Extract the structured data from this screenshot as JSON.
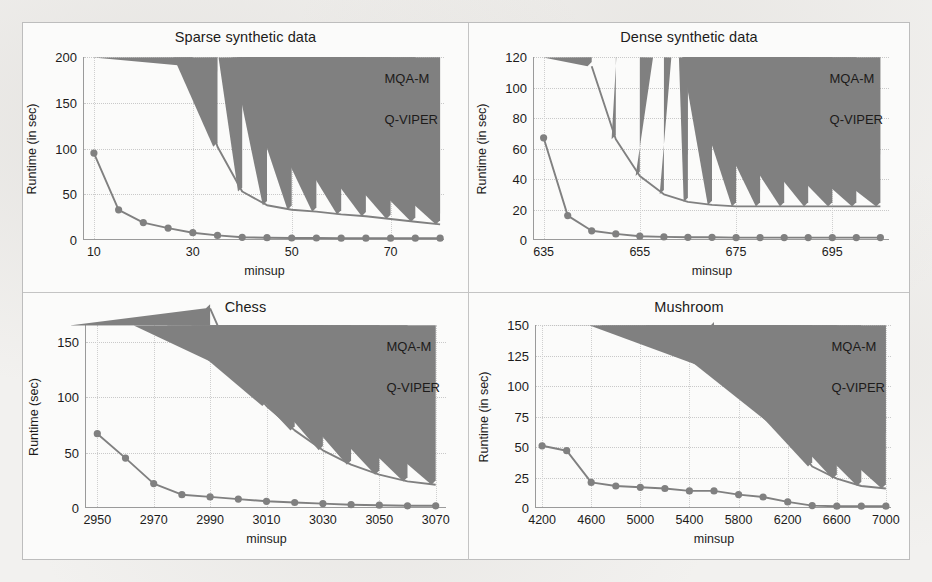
{
  "figure": {
    "background_color": "#fbfbfa",
    "series_color": "#808080",
    "grid_color": "#c9c9c9",
    "axis_color": "#9a9a9a"
  },
  "legend": {
    "series": [
      {
        "name": "MQA-M",
        "marker": "triangle-marker-icon"
      },
      {
        "name": "Q-VIPER",
        "marker": "circle-marker-icon"
      }
    ]
  },
  "chart_data": [
    {
      "id": "sparse-synthetic-data",
      "type": "line",
      "title": "Sparse synthetic data",
      "xlabel": "minsup",
      "ylabel": "Runtime (in sec)",
      "xlim": [
        8,
        81
      ],
      "ylim": [
        0,
        200
      ],
      "xticks": [
        10,
        30,
        50,
        70
      ],
      "xtick_labels": [
        "10",
        "30",
        "50",
        "70"
      ],
      "yticks": [
        0,
        50,
        100,
        150,
        200
      ],
      "ytick_labels": [
        "0",
        "50",
        "100",
        "150",
        "200"
      ],
      "grid": true,
      "legend_position": "top-right-inside",
      "x": [
        10,
        15,
        20,
        25,
        30,
        35,
        40,
        45,
        50,
        55,
        60,
        65,
        70,
        75,
        80
      ],
      "series": [
        {
          "name": "MQA-M",
          "x": [
            30,
            35,
            40,
            45,
            50,
            55,
            60,
            65,
            70,
            75,
            80
          ],
          "values": [
            190,
            102,
            53,
            38,
            33,
            31,
            28,
            26,
            23,
            20,
            17
          ]
        },
        {
          "name": "Q-VIPER",
          "x": [
            10,
            15,
            20,
            25,
            30,
            35,
            40,
            45,
            50,
            55,
            60,
            65,
            70,
            75,
            80
          ],
          "values": [
            95,
            33,
            19,
            13,
            8,
            5,
            3,
            2.5,
            2.2,
            2.2,
            2,
            2,
            2,
            2,
            2
          ]
        }
      ]
    },
    {
      "id": "dense-synthetic-data",
      "type": "line",
      "title": "Dense synthetic data",
      "xlabel": "minsup",
      "ylabel": "Runtime (in sec)",
      "xlim": [
        633,
        707
      ],
      "ylim": [
        0,
        120
      ],
      "xticks": [
        635,
        655,
        675,
        695
      ],
      "xtick_labels": [
        "635",
        "655",
        "675",
        "695"
      ],
      "yticks": [
        0,
        20,
        40,
        60,
        80,
        100,
        120
      ],
      "ytick_labels": [
        "0",
        "20",
        "40",
        "60",
        "80",
        "100",
        "120"
      ],
      "grid": true,
      "legend_position": "top-right-inside",
      "x": [
        635,
        640,
        645,
        650,
        655,
        660,
        665,
        670,
        675,
        680,
        685,
        690,
        695,
        700,
        705
      ],
      "series": [
        {
          "name": "MQA-M",
          "x": [
            645,
            650,
            655,
            660,
            665,
            670,
            675,
            680,
            685,
            690,
            695,
            700,
            705
          ],
          "values": [
            114,
            66,
            42,
            30,
            25,
            23,
            22,
            22,
            22,
            22,
            22,
            22,
            22
          ]
        },
        {
          "name": "Q-VIPER",
          "x": [
            635,
            640,
            645,
            650,
            655,
            660,
            665,
            670,
            675,
            680,
            685,
            690,
            695,
            700,
            705
          ],
          "values": [
            67,
            16,
            6,
            4,
            2.5,
            2,
            1.8,
            1.8,
            1.6,
            1.6,
            1.6,
            1.6,
            1.6,
            1.6,
            1.6
          ]
        }
      ]
    },
    {
      "id": "chess",
      "type": "line",
      "title": "Chess",
      "xlabel": "minsup",
      "ylabel": "Runtime (sec)",
      "xlim": [
        2946,
        3074
      ],
      "ylim": [
        0,
        165
      ],
      "xticks": [
        2950,
        2970,
        2990,
        3010,
        3030,
        3050,
        3070
      ],
      "xtick_labels": [
        "2950",
        "2970",
        "2990",
        "3010",
        "3030",
        "3050",
        "3070"
      ],
      "yticks": [
        0,
        50,
        100,
        150
      ],
      "ytick_labels": [
        "0",
        "50",
        "100",
        "150"
      ],
      "grid": true,
      "legend_position": "top-right-inside",
      "x": [
        2950,
        2960,
        2970,
        2980,
        2990,
        3000,
        3010,
        3020,
        3030,
        3040,
        3050,
        3060,
        3070
      ],
      "series": [
        {
          "name": "MQA-M",
          "x": [
            2990,
            3000,
            3010,
            3020,
            3030,
            3040,
            3050,
            3060,
            3070
          ],
          "values": [
            180,
            122,
            92,
            70,
            52,
            39,
            30,
            24,
            21
          ]
        },
        {
          "name": "Q-VIPER",
          "x": [
            2950,
            2960,
            2970,
            2980,
            2990,
            3000,
            3010,
            3020,
            3030,
            3040,
            3050,
            3060,
            3070
          ],
          "values": [
            67,
            45,
            22,
            12,
            10,
            8,
            6,
            5,
            4,
            3,
            2.5,
            2,
            2
          ]
        }
      ]
    },
    {
      "id": "mushroom",
      "type": "line",
      "title": "Mushroom",
      "xlabel": "minsup",
      "ylabel": "Runtime (in sec)",
      "xlim": [
        4150,
        7050
      ],
      "ylim": [
        0,
        150
      ],
      "xticks": [
        4200,
        4600,
        5000,
        5400,
        5800,
        6200,
        6600,
        7000
      ],
      "xtick_labels": [
        "4200",
        "4600",
        "5000",
        "5400",
        "5800",
        "6200",
        "6600",
        "7000"
      ],
      "yticks": [
        0,
        25,
        50,
        75,
        100,
        125,
        150
      ],
      "ytick_labels": [
        "0",
        "25",
        "50",
        "75",
        "100",
        "125",
        "150"
      ],
      "grid": true,
      "legend_position": "top-right-inside",
      "x": [
        4200,
        4400,
        4600,
        4800,
        5000,
        5200,
        5400,
        5600,
        5800,
        6000,
        6200,
        6400,
        6600,
        6800,
        7000
      ],
      "series": [
        {
          "name": "MQA-M",
          "x": [
            5600,
            5800,
            6000,
            6200,
            6400,
            6600,
            6800,
            7000
          ],
          "values": [
            149,
            106,
            97,
            60,
            34,
            24,
            18,
            16
          ]
        },
        {
          "name": "Q-VIPER",
          "x": [
            4200,
            4400,
            4600,
            4800,
            5000,
            5200,
            5400,
            5600,
            5800,
            6000,
            6200,
            6400,
            6600,
            6800,
            7000
          ],
          "values": [
            51,
            47,
            21,
            18,
            17,
            16,
            14,
            14,
            11,
            9,
            5,
            2,
            1.5,
            1.5,
            1.5
          ]
        }
      ]
    }
  ]
}
